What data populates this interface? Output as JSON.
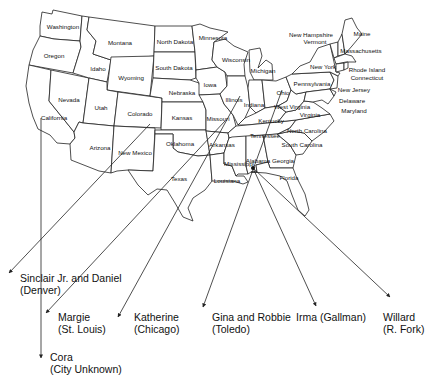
{
  "map": {
    "title": "",
    "origin": {
      "state": "Alabama",
      "x": 253,
      "y": 168
    },
    "colors": {
      "line": "#222222",
      "background": "#ffffff",
      "text": "#111111"
    },
    "states": [
      {
        "name": "Washington",
        "x": 63,
        "y": 27
      },
      {
        "name": "Oregon",
        "x": 54,
        "y": 56
      },
      {
        "name": "California",
        "x": 54,
        "y": 118
      },
      {
        "name": "Nevada",
        "x": 69,
        "y": 100
      },
      {
        "name": "Idaho",
        "x": 98,
        "y": 69
      },
      {
        "name": "Montana",
        "x": 120,
        "y": 43
      },
      {
        "name": "Wyoming",
        "x": 131,
        "y": 78
      },
      {
        "name": "Utah",
        "x": 101,
        "y": 108
      },
      {
        "name": "Colorado",
        "x": 140,
        "y": 114
      },
      {
        "name": "Arizona",
        "x": 100,
        "y": 148
      },
      {
        "name": "New Mexico",
        "x": 135,
        "y": 153
      },
      {
        "name": "North Dakota",
        "x": 175,
        "y": 42
      },
      {
        "name": "South Dakota",
        "x": 174,
        "y": 68
      },
      {
        "name": "Nebraska",
        "x": 182,
        "y": 93
      },
      {
        "name": "Kansas",
        "x": 182,
        "y": 118
      },
      {
        "name": "Oklahoma",
        "x": 180,
        "y": 144
      },
      {
        "name": "Texas",
        "x": 179,
        "y": 179
      },
      {
        "name": "Minnesota",
        "x": 213,
        "y": 38
      },
      {
        "name": "Iowa",
        "x": 210,
        "y": 85
      },
      {
        "name": "Missouri",
        "x": 218,
        "y": 119
      },
      {
        "name": "Arkansas",
        "x": 222,
        "y": 145
      },
      {
        "name": "Louisiana",
        "x": 227,
        "y": 181
      },
      {
        "name": "Wisconsin",
        "x": 236,
        "y": 60
      },
      {
        "name": "Illinois",
        "x": 234,
        "y": 100
      },
      {
        "name": "Michigan",
        "x": 263,
        "y": 71
      },
      {
        "name": "Indiana",
        "x": 254,
        "y": 105
      },
      {
        "name": "Ohio",
        "x": 283,
        "y": 93
      },
      {
        "name": "Kentucky",
        "x": 271,
        "y": 121
      },
      {
        "name": "Tennessee",
        "x": 265,
        "y": 136
      },
      {
        "name": "Mississippi",
        "x": 239,
        "y": 164
      },
      {
        "name": "Alabama",
        "x": 258,
        "y": 161
      },
      {
        "name": "Georgia",
        "x": 283,
        "y": 161
      },
      {
        "name": "Florida",
        "x": 289,
        "y": 178
      },
      {
        "name": "South Carolina",
        "x": 302,
        "y": 145
      },
      {
        "name": "North Carolina",
        "x": 307,
        "y": 131
      },
      {
        "name": "Virginia",
        "x": 310,
        "y": 115
      },
      {
        "name": "West Virginia",
        "x": 292,
        "y": 107
      },
      {
        "name": "Pennsylvania",
        "x": 312,
        "y": 84
      },
      {
        "name": "New York",
        "x": 323,
        "y": 67
      },
      {
        "name": "New Jersey",
        "x": 354,
        "y": 90
      },
      {
        "name": "Delaware",
        "x": 352,
        "y": 101
      },
      {
        "name": "Maryland",
        "x": 354,
        "y": 111
      },
      {
        "name": "New Hampshire",
        "x": 311,
        "y": 35
      },
      {
        "name": "Vermont",
        "x": 315,
        "y": 42
      },
      {
        "name": "Maine",
        "x": 362,
        "y": 34
      },
      {
        "name": "Massachusetts",
        "x": 361,
        "y": 51
      },
      {
        "name": "Rhode Island",
        "x": 367,
        "y": 70
      },
      {
        "name": "Connecticut",
        "x": 367,
        "y": 78
      }
    ]
  },
  "destinations": [
    {
      "id": "sinclair-daniel",
      "name": "Sinclair Jr. and Daniel",
      "city": "(Denver)",
      "label_x": 20,
      "label_y": 272,
      "arrow_x": 9,
      "arrow_y": 273,
      "from_x": 150,
      "from_y": 124
    },
    {
      "id": "margie",
      "name": "Margie",
      "city": "(St. Louis)",
      "label_x": 58,
      "label_y": 311,
      "arrow_x": 46,
      "arrow_y": 313,
      "from_x": 225,
      "from_y": 121
    },
    {
      "id": "katherine",
      "name": "Katherine",
      "city": "(Chicago)",
      "label_x": 134,
      "label_y": 311,
      "arrow_x": 118,
      "arrow_y": 317,
      "from_x": 240,
      "from_y": 96
    },
    {
      "id": "gina-robbie",
      "name": "Gina and Robbie",
      "city": "(Toledo)",
      "label_x": 212,
      "label_y": 311,
      "arrow_x": 203,
      "arrow_y": 307,
      "from_x": 282,
      "from_y": 90
    },
    {
      "id": "irma",
      "name": "Irma (Gallman)",
      "city": "",
      "label_x": 296,
      "label_y": 311,
      "arrow_x": 316,
      "arrow_y": 306,
      "from_x": 253,
      "from_y": 168
    },
    {
      "id": "willard",
      "name": "Willard",
      "city": "(R. Fork)",
      "label_x": 383,
      "label_y": 311,
      "arrow_x": 390,
      "arrow_y": 297,
      "from_x": 253,
      "from_y": 168
    },
    {
      "id": "cora",
      "name": "Cora",
      "city": "(City Unknown)",
      "label_x": 50,
      "label_y": 351,
      "arrow_x": 41,
      "arrow_y": 358,
      "from_x": 41,
      "from_y": 118
    }
  ]
}
